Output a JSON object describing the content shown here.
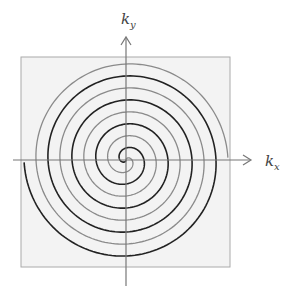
{
  "figure": {
    "type": "spiral k-space trajectory",
    "axes": {
      "x_label": {
        "main": "k",
        "sub": "x"
      },
      "y_label": {
        "main": "k",
        "sub": "y"
      }
    },
    "box": {
      "fill": "#f3f3f3",
      "stroke": "#aaaaaa"
    },
    "spirals": [
      {
        "name": "spiral-interleave-1",
        "color": "#222222",
        "width": 1.6
      },
      {
        "name": "spiral-interleave-2",
        "color": "#8a8a8a",
        "width": 1.3
      }
    ],
    "axis_color": "#777777"
  }
}
